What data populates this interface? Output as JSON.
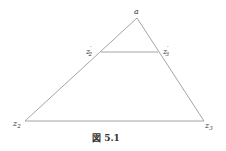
{
  "figure": {
    "caption": "図 5.1",
    "line_color": "#9a9a9a",
    "vertices": {
      "a": {
        "label": "a",
        "x": 137,
        "y": 18
      },
      "z2": {
        "label": "z",
        "sub": "2",
        "x": 25,
        "y": 121
      },
      "z3": {
        "label": "z",
        "sub": "3",
        "x": 204,
        "y": 121
      }
    },
    "inner_points": {
      "z2p": {
        "label": "z",
        "sub": "2",
        "prime": "′",
        "x": 101,
        "y": 52
      },
      "z3p": {
        "label": "z",
        "sub": "3",
        "prime": "′",
        "x": 158,
        "y": 52
      }
    }
  }
}
